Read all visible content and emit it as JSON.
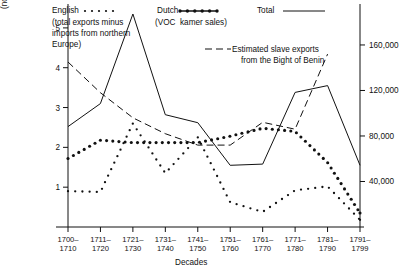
{
  "chart_data": {
    "type": "line",
    "title": "",
    "xlabel": "Decades",
    "ylabel": "(million lbs. avoirdupois)",
    "y2label": "(no. of slaves exported)",
    "categories": [
      "1700–1710",
      "1711–1720",
      "1721–1730",
      "1731–1740",
      "1741–1750",
      "1751–1760",
      "1761–1770",
      "1771–1780",
      "1781–1790",
      "1791–1799"
    ],
    "xtick_top": [
      "1700–",
      "1711–",
      "1721–",
      "1731–",
      "1741–",
      "1751–",
      "1761–",
      "1771–",
      "1781–",
      "1791–"
    ],
    "xtick_bottom": [
      "1710",
      "1720",
      "1730",
      "1740",
      "1750",
      "1760",
      "1770",
      "1780",
      "1790",
      "1799"
    ],
    "ylim": [
      0,
      5.6
    ],
    "yticks": [
      1,
      2,
      3,
      4,
      5
    ],
    "ytick_labels": [
      "1",
      "2",
      "3",
      "4",
      "5"
    ],
    "y2lim": [
      0,
      196000
    ],
    "y2ticks": [
      40000,
      80000,
      120000,
      160000
    ],
    "y2tick_labels": [
      "40,000",
      "80,000",
      "120,000",
      "160,000"
    ],
    "grid": false,
    "legend_position": "top",
    "series": [
      {
        "name": "English",
        "style": "dotted",
        "note": "(total exports minus imports from northern Europe)",
        "axis": "left",
        "values": [
          0.9,
          0.88,
          2.6,
          1.35,
          2.25,
          0.62,
          0.38,
          0.92,
          1.02,
          0.18
        ]
      },
      {
        "name": "Dutch",
        "style": "bold-dotted",
        "note": "(VOC kamer sales)",
        "axis": "left",
        "values": [
          1.72,
          2.18,
          2.12,
          2.12,
          2.12,
          2.28,
          2.48,
          2.4,
          1.62,
          0.35
        ]
      },
      {
        "name": "Total",
        "style": "solid",
        "note": "",
        "axis": "left",
        "values": [
          2.52,
          3.1,
          5.35,
          2.82,
          2.62,
          1.55,
          1.58,
          3.38,
          3.55,
          1.55
        ]
      },
      {
        "name": "Estimated slave exports from the Bight of Benin",
        "style": "dashed",
        "axis": "right",
        "values": [
          145000,
          118000,
          96000,
          82000,
          72000,
          72000,
          92000,
          86000,
          152000,
          null
        ]
      }
    ]
  },
  "legend": {
    "english_label": "English",
    "english_note_line1": "(total exports minus",
    "english_note_line2": "imports from northern",
    "english_note_line3": "Europe)",
    "dutch_label": "Dutch",
    "dutch_note": "(VOC  kamer sales)",
    "total_label": "Total",
    "slaves_line1": "Estimated slave exports",
    "slaves_line2": "from the Bight of Benin"
  },
  "axes": {
    "left_title": "(million lbs. avoirdupois)",
    "right_title": "(no. of slaves exported)",
    "x_title": "Decades"
  },
  "colors": {
    "ink": "#111111",
    "background": "#ffffff"
  }
}
